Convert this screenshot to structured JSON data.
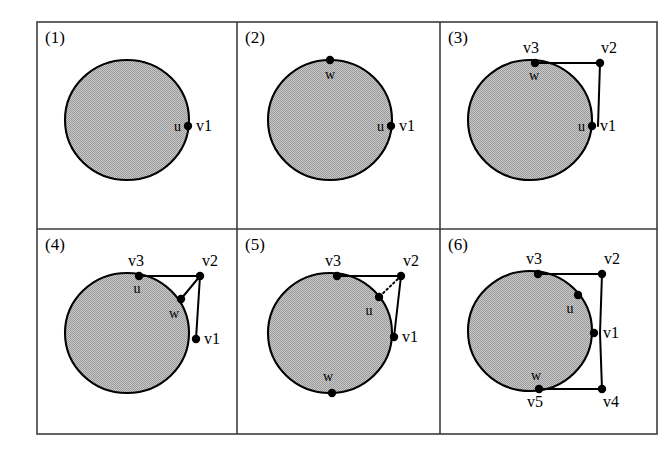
{
  "figure": {
    "background_color": "#ffffff",
    "frame_color": "#3c3c3c",
    "disk_fill_color": "#b4b4b4",
    "disk_outline_color": "#000000",
    "edge_color": "#000000",
    "grid": {
      "rows": 2,
      "cols": 3
    }
  },
  "panels": [
    {
      "id": "panel-1",
      "number_label": "(1)",
      "disk": {
        "cx": 127,
        "cy": 120,
        "rx": 62,
        "ry": 60
      },
      "vertices": [
        {
          "name": "v1-dot",
          "x": 188,
          "y": 126,
          "label": "v1",
          "label_x": 196,
          "label_y": 131,
          "label_anchor": "start"
        },
        {
          "name": "u-label-anchor",
          "x": 188,
          "y": 126,
          "label": "u",
          "label_x": 181,
          "label_y": 131,
          "label_anchor": "end"
        }
      ],
      "edges": [],
      "dotted_edges": []
    },
    {
      "id": "panel-2",
      "number_label": "(2)",
      "disk": {
        "cx": 330,
        "cy": 120,
        "rx": 62,
        "ry": 60
      },
      "vertices": [
        {
          "name": "w-dot",
          "x": 330,
          "y": 60,
          "label": "w",
          "label_x": 330,
          "label_y": 79,
          "label_anchor": "middle"
        },
        {
          "name": "v1-dot",
          "x": 391,
          "y": 126,
          "label": "v1",
          "label_x": 399,
          "label_y": 131,
          "label_anchor": "start"
        },
        {
          "name": "u-label-anchor",
          "x": 391,
          "y": 126,
          "label": "u",
          "label_x": 384,
          "label_y": 131,
          "label_anchor": "end"
        }
      ],
      "edges": [],
      "dotted_edges": []
    },
    {
      "id": "panel-3",
      "number_label": "(3)",
      "disk": {
        "cx": 530,
        "cy": 120,
        "rx": 62,
        "ry": 60
      },
      "vertices": [
        {
          "name": "v3-dot",
          "x": 535,
          "y": 63,
          "label": "v3",
          "label_x": 531,
          "label_y": 53,
          "label_anchor": "middle"
        },
        {
          "name": "w-label-anchor",
          "x": 535,
          "y": 63,
          "label": "w",
          "label_x": 534,
          "label_y": 80,
          "label_anchor": "middle"
        },
        {
          "name": "v2-dot",
          "x": 600,
          "y": 63,
          "label": "v2",
          "label_x": 609,
          "label_y": 53,
          "label_anchor": "middle"
        },
        {
          "name": "v1-dot",
          "x": 592,
          "y": 126,
          "label": "v1",
          "label_x": 600,
          "label_y": 131,
          "label_anchor": "start"
        },
        {
          "name": "u-label-anchor",
          "x": 592,
          "y": 126,
          "label": "u",
          "label_x": 585,
          "label_y": 131,
          "label_anchor": "end"
        }
      ],
      "edges": [
        {
          "name": "edge-v3-v2",
          "x1": 535,
          "y1": 63,
          "x2": 600,
          "y2": 63
        },
        {
          "name": "edge-v2-v1",
          "x1": 600,
          "y1": 63,
          "x2": 598,
          "y2": 126
        }
      ],
      "dotted_edges": []
    },
    {
      "id": "panel-4",
      "number_label": "(4)",
      "disk": {
        "cx": 127,
        "cy": 333,
        "rx": 62,
        "ry": 60
      },
      "vertices": [
        {
          "name": "v3-dot",
          "x": 139,
          "y": 276,
          "label": "v3",
          "label_x": 136,
          "label_y": 266,
          "label_anchor": "middle"
        },
        {
          "name": "u-label-anchor",
          "x": 139,
          "y": 276,
          "label": "u",
          "label_x": 137,
          "label_y": 293,
          "label_anchor": "middle"
        },
        {
          "name": "v2-dot",
          "x": 200,
          "y": 276,
          "label": "v2",
          "label_x": 210,
          "label_y": 266,
          "label_anchor": "middle"
        },
        {
          "name": "w-dot",
          "x": 181,
          "y": 299,
          "label": "w",
          "label_x": 174,
          "label_y": 318,
          "label_anchor": "middle"
        },
        {
          "name": "v1-dot",
          "x": 196,
          "y": 339,
          "label": "v1",
          "label_x": 204,
          "label_y": 344,
          "label_anchor": "start"
        }
      ],
      "edges": [
        {
          "name": "edge-v3-v2",
          "x1": 139,
          "y1": 276,
          "x2": 200,
          "y2": 276
        },
        {
          "name": "edge-v2-w",
          "x1": 200,
          "y1": 276,
          "x2": 181,
          "y2": 299
        },
        {
          "name": "edge-v2-v1",
          "x1": 200,
          "y1": 276,
          "x2": 196,
          "y2": 339
        }
      ],
      "dotted_edges": []
    },
    {
      "id": "panel-5",
      "number_label": "(5)",
      "disk": {
        "cx": 330,
        "cy": 333,
        "rx": 62,
        "ry": 60
      },
      "vertices": [
        {
          "name": "v3-dot",
          "x": 337,
          "y": 276,
          "label": "v3",
          "label_x": 333,
          "label_y": 266,
          "label_anchor": "middle"
        },
        {
          "name": "v2-dot",
          "x": 401,
          "y": 276,
          "label": "v2",
          "label_x": 411,
          "label_y": 266,
          "label_anchor": "middle"
        },
        {
          "name": "u-dot",
          "x": 379,
          "y": 297,
          "label": "u",
          "label_x": 369,
          "label_y": 315,
          "label_anchor": "middle"
        },
        {
          "name": "v1-dot",
          "x": 394,
          "y": 337,
          "label": "v1",
          "label_x": 402,
          "label_y": 342,
          "label_anchor": "start"
        },
        {
          "name": "w-dot",
          "x": 332,
          "y": 393,
          "label": "w",
          "label_x": 328,
          "label_y": 381,
          "label_anchor": "middle"
        }
      ],
      "edges": [
        {
          "name": "edge-v3-v2",
          "x1": 337,
          "y1": 276,
          "x2": 401,
          "y2": 276
        },
        {
          "name": "edge-v2-v1",
          "x1": 401,
          "y1": 276,
          "x2": 394,
          "y2": 337
        }
      ],
      "dotted_edges": [
        {
          "name": "edge-v2-u-dotted",
          "x1": 401,
          "y1": 276,
          "x2": 379,
          "y2": 297
        }
      ]
    },
    {
      "id": "panel-6",
      "number_label": "(6)",
      "disk": {
        "cx": 530,
        "cy": 331,
        "rx": 62,
        "ry": 60
      },
      "vertices": [
        {
          "name": "v3-dot",
          "x": 538,
          "y": 274,
          "label": "v3",
          "label_x": 534,
          "label_y": 264,
          "label_anchor": "middle"
        },
        {
          "name": "v2-dot",
          "x": 602,
          "y": 274,
          "label": "v2",
          "label_x": 612,
          "label_y": 264,
          "label_anchor": "middle"
        },
        {
          "name": "u-dot",
          "x": 578,
          "y": 295,
          "label": "u",
          "label_x": 570,
          "label_y": 313,
          "label_anchor": "middle"
        },
        {
          "name": "v1-dot",
          "x": 594,
          "y": 333,
          "label": "v1",
          "label_x": 603,
          "label_y": 338,
          "label_anchor": "start"
        },
        {
          "name": "w-label-anchor",
          "x": 539,
          "y": 389,
          "label": "w",
          "label_x": 536,
          "label_y": 380,
          "label_anchor": "middle"
        },
        {
          "name": "v5-dot",
          "x": 539,
          "y": 389,
          "label": "v5",
          "label_x": 535,
          "label_y": 407,
          "label_anchor": "middle"
        },
        {
          "name": "v4-dot",
          "x": 602,
          "y": 389,
          "label": "v4",
          "label_x": 611,
          "label_y": 407,
          "label_anchor": "middle"
        }
      ],
      "edges": [
        {
          "name": "edge-v3-v2",
          "x1": 538,
          "y1": 274,
          "x2": 602,
          "y2": 274
        },
        {
          "name": "edge-v2-v1",
          "x1": 602,
          "y1": 274,
          "x2": 600,
          "y2": 333
        },
        {
          "name": "edge-v1-v4",
          "x1": 600,
          "y1": 333,
          "x2": 602,
          "y2": 389
        },
        {
          "name": "edge-v4-v5",
          "x1": 602,
          "y1": 389,
          "x2": 539,
          "y2": 389
        }
      ],
      "dotted_edges": []
    }
  ],
  "frame": {
    "x": 37,
    "y": 22,
    "width": 620,
    "height": 412,
    "col_dividers": [
      237,
      440
    ],
    "row_dividers": [
      229
    ]
  }
}
